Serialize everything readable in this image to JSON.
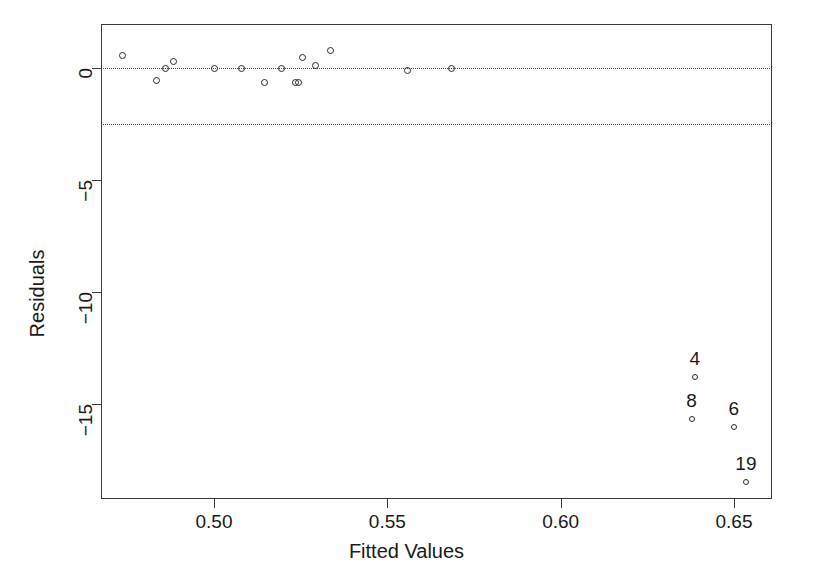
{
  "chart_data": {
    "type": "scatter",
    "title": "",
    "xlabel": "Fitted Values",
    "ylabel": "Residuals",
    "xlim": [
      0.4706,
      0.6641
    ],
    "ylim": [
      -19.0,
      1.95
    ],
    "grid": false,
    "legend": null,
    "xticks": [
      0.5,
      0.55,
      0.6,
      0.65
    ],
    "xticklabels": [
      "0.50",
      "0.55",
      "0.60",
      "0.65"
    ],
    "yticks": [
      0,
      -5,
      -10,
      -15
    ],
    "yticklabels": [
      "0",
      "-5",
      "-10",
      "-15"
    ],
    "reference_lines": [
      {
        "name": "zero-line",
        "y": 0,
        "style": "dotted"
      },
      {
        "name": "lower-threshold-line",
        "y": -2.5,
        "style": "dotted"
      }
    ],
    "marker": "open-circle",
    "points": [
      {
        "x": 0.4735,
        "y": 0.54,
        "label": ""
      },
      {
        "x": 0.4833,
        "y": -0.54,
        "label": ""
      },
      {
        "x": 0.4859,
        "y": 0.0,
        "label": ""
      },
      {
        "x": 0.4882,
        "y": 0.27,
        "label": ""
      },
      {
        "x": 0.5,
        "y": 0.0,
        "label": ""
      },
      {
        "x": 0.5078,
        "y": 0.0,
        "label": ""
      },
      {
        "x": 0.5147,
        "y": -0.63,
        "label": ""
      },
      {
        "x": 0.5196,
        "y": 0.0,
        "label": ""
      },
      {
        "x": 0.5236,
        "y": -0.63,
        "label": ""
      },
      {
        "x": 0.5245,
        "y": -0.63,
        "label": ""
      },
      {
        "x": 0.5254,
        "y": 0.45,
        "label": ""
      },
      {
        "x": 0.5294,
        "y": 0.13,
        "label": ""
      },
      {
        "x": 0.5335,
        "y": 0.8,
        "label": ""
      },
      {
        "x": 0.5559,
        "y": -0.13,
        "label": ""
      },
      {
        "x": 0.5686,
        "y": 0.0,
        "label": ""
      },
      {
        "x": 0.6387,
        "y": -13.8,
        "label": "4"
      },
      {
        "x": 0.6378,
        "y": -15.67,
        "label": "8"
      },
      {
        "x": 0.65,
        "y": -16.03,
        "label": "6"
      },
      {
        "x": 0.6535,
        "y": -18.48,
        "label": "19"
      }
    ]
  },
  "colors": {
    "marker_stroke": "#2b2b2b",
    "axis": "#3a3a3a",
    "reference_line": "#4a4a4a",
    "text": "#1a1a1a",
    "background": "#fefefe"
  }
}
